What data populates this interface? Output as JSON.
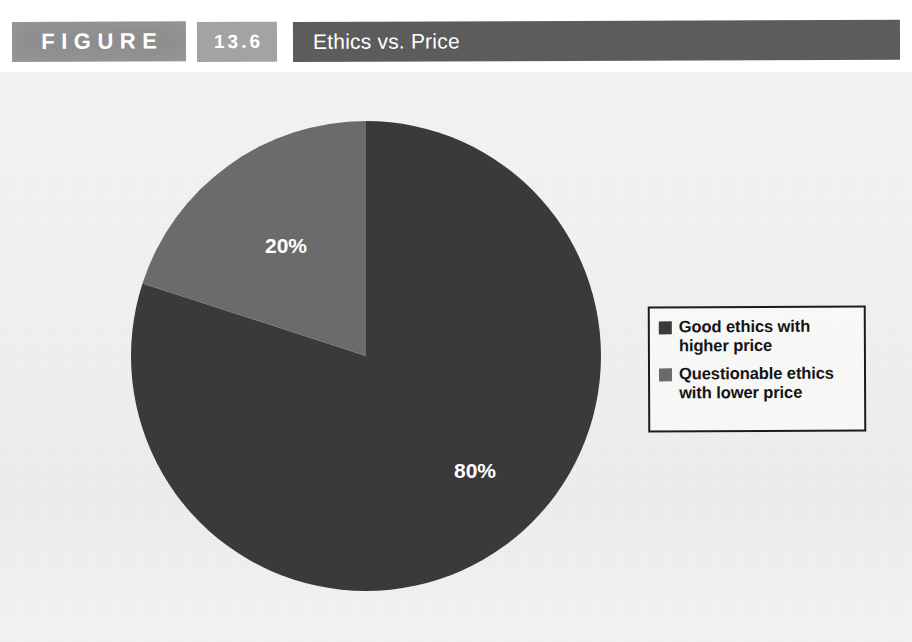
{
  "header": {
    "figure_label": "FIGURE",
    "figure_number": "13.6",
    "title": "Ethics vs. Price",
    "figure_block_color": "#8e8e8e",
    "number_block_color": "#a3a3a3",
    "title_block_color": "#5c5c5c"
  },
  "legend": {
    "items": [
      {
        "label": "Good ethics with higher price",
        "color": "#3a3a3a"
      },
      {
        "label": "Questionable ethics with lower price",
        "color": "#6b6b6b"
      }
    ]
  },
  "chart_data": {
    "type": "pie",
    "title": "Ethics vs. Price",
    "categories": [
      "Good ethics with higher price",
      "Questionable ethics with lower price"
    ],
    "values": [
      80,
      20
    ],
    "labels": [
      "80%",
      "20%"
    ],
    "colors": [
      "#3a3a3a",
      "#6b6b6b"
    ],
    "unit": "%",
    "start_angle_deg": 0,
    "direction": "clockwise",
    "legend_position": "right",
    "grid": false,
    "xlabel": "",
    "ylabel": ""
  }
}
